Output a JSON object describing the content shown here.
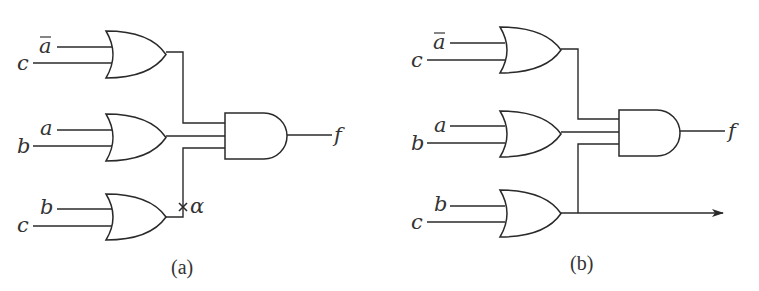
{
  "figure": {
    "panels": [
      {
        "id": "a",
        "caption": "(a)",
        "gates": [
          {
            "type": "OR",
            "inputs": [
              "ā",
              "c"
            ]
          },
          {
            "type": "OR",
            "inputs": [
              "a",
              "b"
            ]
          },
          {
            "type": "OR",
            "inputs": [
              "b",
              "c"
            ]
          },
          {
            "type": "AND",
            "inputs": [
              "OR1",
              "OR2",
              "OR3"
            ],
            "output": "f"
          }
        ],
        "labels": {
          "in1a": "a",
          "in1b": "c",
          "in2a": "a",
          "in2b": "b",
          "in3a": "b",
          "in3b": "c",
          "output": "f",
          "fault": "α",
          "fault_mark": "×"
        }
      },
      {
        "id": "b",
        "caption": "(b)",
        "gates": [
          {
            "type": "OR",
            "inputs": [
              "ā",
              "c"
            ]
          },
          {
            "type": "OR",
            "inputs": [
              "a",
              "b"
            ]
          },
          {
            "type": "OR",
            "inputs": [
              "b",
              "c"
            ]
          },
          {
            "type": "AND",
            "inputs": [
              "OR1",
              "OR2",
              "OR3"
            ],
            "output": "f"
          }
        ],
        "labels": {
          "in1a": "a",
          "in1b": "c",
          "in2a": "a",
          "in2b": "b",
          "in3a": "b",
          "in3b": "c",
          "output": "f"
        },
        "extra_output": "arrow from third OR gate output"
      }
    ]
  }
}
